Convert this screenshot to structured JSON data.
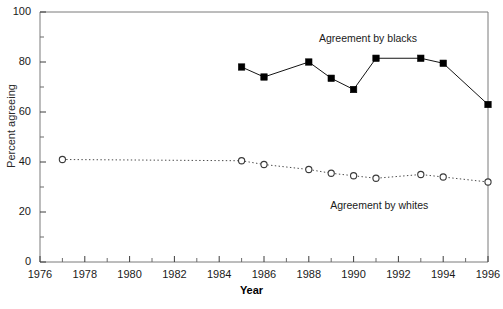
{
  "chart_data": {
    "type": "line",
    "title": "",
    "xlabel": "Year",
    "ylabel": "Percent agreeing",
    "xlim": [
      1976,
      1996
    ],
    "ylim": [
      0,
      100
    ],
    "grid": false,
    "legend_position": "inline-annotations",
    "x_ticks": [
      1976,
      1978,
      1980,
      1982,
      1984,
      1986,
      1988,
      1990,
      1992,
      1994,
      1996
    ],
    "x_tick_labels": [
      "1976",
      "1978",
      "1980",
      "1982",
      "1984",
      "1986",
      "1988",
      "1990",
      "1992",
      "1994",
      "1996"
    ],
    "x_minor_ticks": [
      1977,
      1979,
      1981,
      1983,
      1985,
      1987,
      1989,
      1991,
      1993,
      1995
    ],
    "y_ticks": [
      0,
      20,
      40,
      60,
      80,
      100
    ],
    "y_tick_labels": [
      "0",
      "20",
      "40",
      "60",
      "80",
      "100"
    ],
    "y_minor_ticks": [
      10,
      30,
      50,
      70,
      90
    ],
    "series": [
      {
        "name": "Agreement by blacks",
        "marker": "filled-square",
        "line_style": "solid",
        "color": "#000000",
        "annotation": "Agreement by blacks",
        "x": [
          1985,
          1986,
          1988,
          1989,
          1990,
          1991,
          1993,
          1994,
          1996
        ],
        "values": [
          78,
          74,
          80,
          73.5,
          69,
          81.5,
          81.5,
          79.5,
          63
        ]
      },
      {
        "name": "Agreement by whites",
        "marker": "open-circle",
        "line_style": "dotted",
        "color": "#555555",
        "annotation": "Agreement by whites",
        "x": [
          1977,
          1985,
          1986,
          1988,
          1989,
          1990,
          1991,
          1993,
          1994,
          1996
        ],
        "values": [
          41,
          40.5,
          39,
          37,
          35.5,
          34.5,
          33.5,
          35,
          34,
          32
        ]
      }
    ],
    "annotations": [
      {
        "text": "Agreement by blacks",
        "x": 1991.0,
        "y": 89
      },
      {
        "text": "Agreement by whites",
        "x": 1991.5,
        "y": 22
      }
    ]
  }
}
